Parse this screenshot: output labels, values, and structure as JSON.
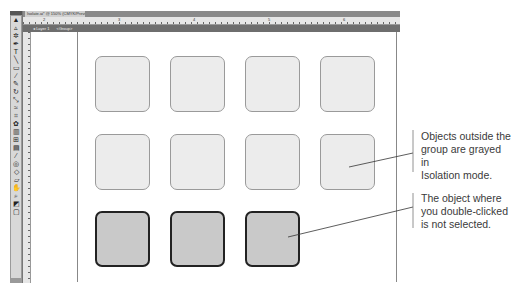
{
  "window": {
    "tab_title": "Isolate.ai* @ 150% (CMYK/Preview)"
  },
  "isolation_bar": {
    "layer_label": "Layer 1",
    "group_label": "<Group>"
  },
  "ruler": {
    "h_ticks": [
      "2",
      "3",
      "4",
      "5",
      "6"
    ],
    "v_ticks": [
      "1",
      "2",
      "3",
      "4"
    ]
  },
  "toolbox": {
    "tools": [
      "selection",
      "direct-selection",
      "magic-wand",
      "pen",
      "type",
      "line",
      "rectangle",
      "paintbrush",
      "pencil",
      "rotate",
      "scale",
      "warp",
      "free-transform",
      "symbol-sprayer",
      "graph",
      "mesh",
      "gradient",
      "eyedropper",
      "blend",
      "slice",
      "eraser",
      "hand",
      "zoom",
      "fill-stroke",
      "screen-mode"
    ]
  },
  "canvas": {
    "tiles": [
      {
        "row": 1,
        "col": 1,
        "state": "grayed"
      },
      {
        "row": 1,
        "col": 2,
        "state": "grayed"
      },
      {
        "row": 1,
        "col": 3,
        "state": "grayed"
      },
      {
        "row": 1,
        "col": 4,
        "state": "grayed"
      },
      {
        "row": 2,
        "col": 1,
        "state": "grayed"
      },
      {
        "row": 2,
        "col": 2,
        "state": "grayed"
      },
      {
        "row": 2,
        "col": 3,
        "state": "grayed"
      },
      {
        "row": 2,
        "col": 4,
        "state": "grayed"
      },
      {
        "row": 3,
        "col": 1,
        "state": "active"
      },
      {
        "row": 3,
        "col": 2,
        "state": "active"
      },
      {
        "row": 3,
        "col": 3,
        "state": "active"
      }
    ]
  },
  "callouts": [
    {
      "lines": [
        "Objects outside the",
        "group are grayed in",
        "Isolation mode."
      ]
    },
    {
      "lines": [
        "The object where",
        "you double-clicked",
        "is not selected."
      ]
    }
  ],
  "colors": {
    "grayed_fill": "#ececec",
    "active_fill": "#c9c9c9",
    "active_stroke": "#222222"
  }
}
